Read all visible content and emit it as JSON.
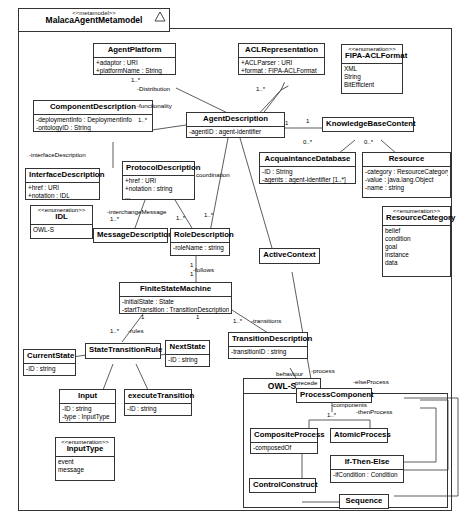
{
  "diagram": {
    "title": "MalacaAgentMetamodel",
    "stereotype": "<<metamodel>>",
    "icon": "triangle-icon"
  },
  "packages": [
    {
      "id": "owls",
      "name": "OWL-S"
    }
  ],
  "classes": [
    {
      "id": "agentplatform",
      "name": "AgentPlatform",
      "stereotype": "",
      "attributes": [
        "+adaptor : URI",
        "+platformName : String"
      ]
    },
    {
      "id": "aclrepresentation",
      "name": "ACLRepresentation",
      "stereotype": "",
      "attributes": [
        "+ACLParser : URI",
        "+format : FIPA-ACLFormat"
      ]
    },
    {
      "id": "fipaaclformat",
      "name": "FIPA-ACLFormat",
      "stereotype": "<<enumeration>>",
      "attributes": [
        "XML",
        "String",
        "BitEfficient"
      ]
    },
    {
      "id": "componentdescription",
      "name": "ComponentDescription",
      "stereotype": "",
      "attributes": [
        "-deploymentInfo : DeploymentInfo",
        "-ontologyID : String"
      ]
    },
    {
      "id": "agentdescription",
      "name": "AgentDescription",
      "stereotype": "",
      "attributes": [
        "-agentID : agent-identifier"
      ]
    },
    {
      "id": "knowledgebasecontent",
      "name": "KnowledgeBaseContent",
      "stereotype": "",
      "attributes": []
    },
    {
      "id": "acquaintancedatabase",
      "name": "AcquaintanceDatabase",
      "stereotype": "",
      "attributes": [
        "-ID : String",
        "-agents : agent-identifier [1..*]"
      ]
    },
    {
      "id": "resource",
      "name": "Resource",
      "stereotype": "",
      "attributes": [
        "-category : ResourceCategory",
        "-value : java.lang.Object",
        "-name : string",
        "..."
      ]
    },
    {
      "id": "resourcecategory",
      "name": "ResourceCategory",
      "stereotype": "<<enumeration>>",
      "attributes": [
        "belief",
        "condition",
        "goal",
        "instance",
        "data"
      ]
    },
    {
      "id": "interfacedescription",
      "name": "InterfaceDescription",
      "stereotype": "",
      "attributes": [
        "+href : URI",
        "+notation : IDL"
      ]
    },
    {
      "id": "idl",
      "name": "IDL",
      "stereotype": "<<enumeration>>",
      "attributes": [
        "OWL-S"
      ]
    },
    {
      "id": "protocoldescription",
      "name": "ProtocolDescription",
      "stereotype": "",
      "attributes": [
        "+href : URI",
        "+notation : string",
        "..."
      ]
    },
    {
      "id": "messagedescription",
      "name": "MessageDescription",
      "stereotype": "",
      "attributes": []
    },
    {
      "id": "roledescription",
      "name": "RoleDescription",
      "stereotype": "",
      "attributes": [
        "-roleName : string"
      ]
    },
    {
      "id": "activecontext",
      "name": "ActiveContext",
      "stereotype": "",
      "attributes": []
    },
    {
      "id": "finitestatemachine",
      "name": "FiniteStateMachine",
      "stereotype": "",
      "attributes": [
        "-initialState : State",
        "-startTransition : TransitionDescription"
      ]
    },
    {
      "id": "transitiondescription",
      "name": "TransitionDescription",
      "stereotype": "",
      "attributes": [
        "-transitionID : string"
      ]
    },
    {
      "id": "currentstate",
      "name": "CurrentState",
      "stereotype": "",
      "attributes": [
        "-ID : string"
      ]
    },
    {
      "id": "statetransitionrule",
      "name": "StateTransitionRule",
      "stereotype": "",
      "attributes": []
    },
    {
      "id": "nextstate",
      "name": "NextState",
      "stereotype": "",
      "attributes": [
        "-ID : string"
      ]
    },
    {
      "id": "input",
      "name": "Input",
      "stereotype": "",
      "attributes": [
        "-ID : string",
        "-type : InputType"
      ]
    },
    {
      "id": "executetransition",
      "name": "executeTransition",
      "stereotype": "",
      "attributes": [
        "-ID : string"
      ]
    },
    {
      "id": "inputtype",
      "name": "InputType",
      "stereotype": "<<enumeration>>",
      "attributes": [
        "event",
        "message"
      ]
    },
    {
      "id": "processcomponent",
      "name": "ProcessComponent",
      "stereotype": "",
      "attributes": []
    },
    {
      "id": "compositeprocess",
      "name": "CompositeProcess",
      "stereotype": "",
      "attributes": [
        "-composedOf"
      ]
    },
    {
      "id": "atomicprocess",
      "name": "AtomicProcess",
      "stereotype": "",
      "attributes": []
    },
    {
      "id": "ifthenelse",
      "name": "If-Then-Else",
      "stereotype": "",
      "attributes": [
        "-ifCondition : Condition"
      ]
    },
    {
      "id": "controlconstruct",
      "name": "ControlConstruct",
      "stereotype": "",
      "attributes": []
    },
    {
      "id": "sequence",
      "name": "Sequence",
      "stereotype": "",
      "attributes": []
    }
  ],
  "edge_labels": [
    {
      "id": "distribution",
      "text": "-Distribution"
    },
    {
      "id": "functionality",
      "text": "-functionality"
    },
    {
      "id": "interface_description",
      "text": "-interfaceDescription"
    },
    {
      "id": "coordination",
      "text": "coordination"
    },
    {
      "id": "interchange_message",
      "text": "-interchangeMessage"
    },
    {
      "id": "follows",
      "text": "-follows"
    },
    {
      "id": "transitions",
      "text": "-transitions"
    },
    {
      "id": "rules",
      "text": "-rules"
    },
    {
      "id": "behaviour",
      "text": "behaviour"
    },
    {
      "id": "process",
      "text": "-process"
    },
    {
      "id": "precede",
      "text": "-precede"
    },
    {
      "id": "else_process",
      "text": "-elseProcess"
    },
    {
      "id": "components",
      "text": "-components"
    },
    {
      "id": "then_process",
      "text": "-thenProcess"
    }
  ],
  "multiplicities": [
    {
      "id": "m-platform",
      "text": "1..*"
    },
    {
      "id": "m-acl",
      "text": "1..*"
    },
    {
      "id": "m-component",
      "text": "1..*"
    },
    {
      "id": "m-kb-left",
      "text": "1"
    },
    {
      "id": "m-kb-right",
      "text": "1"
    },
    {
      "id": "m-acq",
      "text": "0..*"
    },
    {
      "id": "m-res",
      "text": "0..*"
    },
    {
      "id": "m-msg",
      "text": "1..*"
    },
    {
      "id": "m-role-proto",
      "text": "1..*"
    },
    {
      "id": "m-role-agent",
      "text": "1..*"
    },
    {
      "id": "m-role-one",
      "text": "1"
    },
    {
      "id": "m-fsm-one",
      "text": "1"
    },
    {
      "id": "m-fsm-left",
      "text": "1"
    },
    {
      "id": "m-fsm-mid",
      "text": "1"
    },
    {
      "id": "m-trans",
      "text": "1..*"
    },
    {
      "id": "m-rules",
      "text": "1..*"
    },
    {
      "id": "m-proccomp",
      "text": "1..*"
    }
  ]
}
